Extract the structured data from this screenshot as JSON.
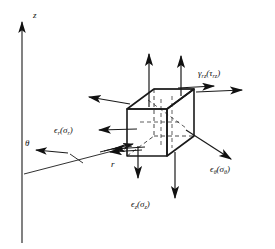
{
  "figure": {
    "background_color": "#ffffff",
    "line_color": "#1a1a1a",
    "width": 275,
    "height": 249
  },
  "axes": [
    {
      "id": "z-axis",
      "label": "z",
      "direction": "vertical-up",
      "x": 22,
      "label_x": 33,
      "label_y": 16
    },
    {
      "id": "r-axis",
      "label": "r",
      "direction": "diagonal-right-up",
      "label_x": 113,
      "label_y": 166
    },
    {
      "id": "theta-axis",
      "label": "θ",
      "direction": "arrow-left",
      "label_x": 26,
      "label_y": 148
    }
  ],
  "labels": {
    "gamma_rz": {
      "text": "γᵣᶻ(τᵣᶻ)",
      "symbol": "γ",
      "subscript": "rz",
      "paren_symbol": "τ",
      "paren_subscript": "rz",
      "x": 199,
      "y": 75,
      "component": "shear strain (shear stress) in r-z plane"
    },
    "epsilon_r": {
      "text": "ϵᵣ(σᵣ)",
      "symbol": "ϵ",
      "subscript": "r",
      "paren_symbol": "σ",
      "paren_subscript": "r",
      "x": 56,
      "y": 132,
      "component": "radial strain (radial stress)"
    },
    "epsilon_theta": {
      "text": "ϵθ(σθ)",
      "symbol": "ϵ",
      "subscript": "θ",
      "paren_symbol": "σ",
      "paren_subscript": "θ",
      "x": 212,
      "y": 171,
      "component": "circumferential strain (hoop stress)"
    },
    "epsilon_z": {
      "text": "ϵᶻ(σᶻ)",
      "symbol": "ϵ",
      "subscript": "z",
      "paren_symbol": "σ",
      "paren_subscript": "z",
      "x": 133,
      "y": 206,
      "component": "axial strain (axial stress)"
    }
  },
  "element": {
    "shape": "cube",
    "style": "isometric with hidden dashed edges",
    "front_face_top_left": [
      127,
      107
    ],
    "front_face_bottom_right": [
      176,
      158
    ]
  },
  "arrows": [
    {
      "name": "axial-up-front",
      "direction": "up",
      "from": [
        149,
        110
      ],
      "to": [
        149,
        53
      ]
    },
    {
      "name": "axial-up-back",
      "direction": "up",
      "from": [
        179,
        97
      ],
      "to": [
        179,
        55
      ]
    },
    {
      "name": "axial-down-front",
      "direction": "down",
      "from": [
        138,
        143
      ],
      "to": [
        138,
        178
      ]
    },
    {
      "name": "axial-down-back",
      "direction": "down",
      "from": [
        174,
        155
      ],
      "to": [
        174,
        200
      ]
    },
    {
      "name": "radial-left-upper",
      "direction": "left",
      "from": [
        128,
        105
      ],
      "to": [
        86,
        96
      ]
    },
    {
      "name": "radial-left-lower",
      "direction": "left",
      "from": [
        135,
        131
      ],
      "to": [
        96,
        131
      ]
    },
    {
      "name": "hoop-right-upper",
      "direction": "right",
      "from": [
        196,
        88
      ],
      "to": [
        243,
        88
      ]
    },
    {
      "name": "hoop-right-lower",
      "direction": "right",
      "from": [
        188,
        130
      ],
      "to": [
        233,
        160
      ]
    },
    {
      "name": "shear-top-right",
      "direction": "right",
      "from": [
        182,
        88
      ],
      "to": [
        218,
        85
      ]
    },
    {
      "name": "shear-bottom-left",
      "direction": "left",
      "from": [
        142,
        148
      ],
      "to": [
        108,
        152
      ]
    },
    {
      "name": "theta-arrow",
      "direction": "left",
      "from": [
        66,
        152
      ],
      "to": [
        33,
        152
      ]
    }
  ]
}
